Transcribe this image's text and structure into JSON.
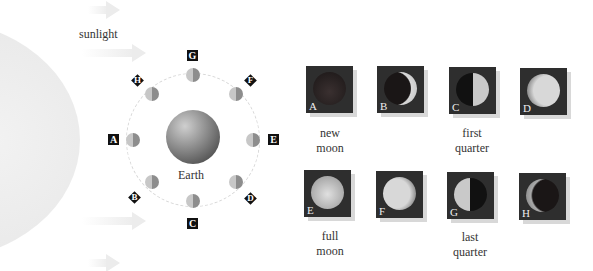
{
  "diagram": {
    "sunlight_label": "sunlight",
    "earth_label": "Earth",
    "orbit_positions": [
      {
        "letter": "A",
        "position": "left"
      },
      {
        "letter": "B",
        "position": "lower-left"
      },
      {
        "letter": "C",
        "position": "bottom"
      },
      {
        "letter": "D",
        "position": "lower-right"
      },
      {
        "letter": "E",
        "position": "right"
      },
      {
        "letter": "F",
        "position": "upper-right"
      },
      {
        "letter": "G",
        "position": "top"
      },
      {
        "letter": "H",
        "position": "upper-left"
      }
    ],
    "phases": [
      {
        "letter": "A",
        "caption_line1": "new",
        "caption_line2": "moon"
      },
      {
        "letter": "B",
        "caption_line1": "",
        "caption_line2": ""
      },
      {
        "letter": "C",
        "caption_line1": "first",
        "caption_line2": "quarter"
      },
      {
        "letter": "D",
        "caption_line1": "",
        "caption_line2": ""
      },
      {
        "letter": "E",
        "caption_line1": "full",
        "caption_line2": "moon"
      },
      {
        "letter": "F",
        "caption_line1": "",
        "caption_line2": ""
      },
      {
        "letter": "G",
        "caption_line1": "last",
        "caption_line2": "quarter"
      },
      {
        "letter": "H",
        "caption_line1": "",
        "caption_line2": ""
      }
    ]
  }
}
